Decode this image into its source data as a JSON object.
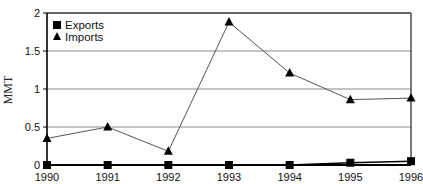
{
  "chart_data": {
    "type": "line",
    "title": "",
    "xlabel": "",
    "ylabel": "MMT",
    "categories": [
      "1990",
      "1991",
      "1992",
      "1993",
      "1994",
      "1995",
      "1996"
    ],
    "ylim": [
      0,
      2
    ],
    "yticks": [
      "0",
      "0.5",
      "1",
      "1.5",
      "2"
    ],
    "ytick_values": [
      0,
      0.5,
      1,
      1.5,
      2
    ],
    "grid": "horizontal",
    "legend_position": "top-left inside",
    "series": [
      {
        "name": "Exports",
        "marker": "square",
        "values": [
          0,
          0,
          0,
          0,
          0,
          0.03,
          0.05
        ]
      },
      {
        "name": "Imports",
        "marker": "triangle",
        "values": [
          0.35,
          0.5,
          0.18,
          1.88,
          1.21,
          0.86,
          0.88
        ]
      }
    ]
  },
  "colors": {
    "axis": "#000000",
    "grid": "#8a8a8a",
    "series_line": "#555555",
    "marker": "#000000"
  }
}
